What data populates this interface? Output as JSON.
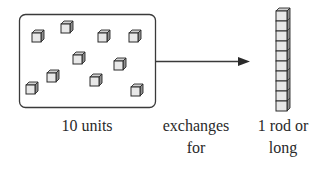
{
  "diagram": {
    "labels": {
      "units": "10 units",
      "exchanges_line1": "exchanges",
      "exchanges_line2": "for",
      "rod_line1": "1 rod or",
      "rod_line2": "long"
    },
    "units_box": {
      "unit_count": 10,
      "cube_positions": [
        [
          33,
          33
        ],
        [
          62,
          24
        ],
        [
          99,
          33
        ],
        [
          130,
          33
        ],
        [
          74,
          55
        ],
        [
          115,
          61
        ],
        [
          48,
          73
        ],
        [
          91,
          77
        ],
        [
          27,
          85
        ],
        [
          132,
          87
        ]
      ]
    },
    "rod": {
      "segment_count": 10
    },
    "colors": {
      "stroke": "#2a2a2a",
      "cube_face": "#e6e6e6",
      "cube_side": "#9a9a9a",
      "cube_top": "#cfcfcf",
      "box_border": "#3a3a3a"
    }
  }
}
